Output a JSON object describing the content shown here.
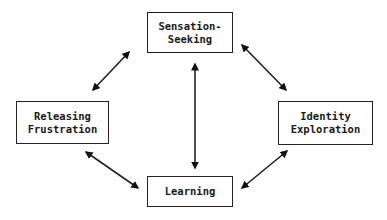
{
  "diagram": {
    "nodes": [
      {
        "id": "sensation",
        "label": "Sensation-\nSeeking"
      },
      {
        "id": "releasing",
        "label": "Releasing\nFrustration"
      },
      {
        "id": "identity",
        "label": "Identity\nExploration"
      },
      {
        "id": "learning",
        "label": "Learning"
      }
    ],
    "edges": [
      {
        "from": "sensation",
        "to": "releasing",
        "type": "bidirectional"
      },
      {
        "from": "sensation",
        "to": "identity",
        "type": "bidirectional"
      },
      {
        "from": "sensation",
        "to": "learning",
        "type": "bidirectional"
      },
      {
        "from": "releasing",
        "to": "learning",
        "type": "bidirectional"
      },
      {
        "from": "identity",
        "to": "learning",
        "type": "bidirectional"
      }
    ],
    "colors": {
      "stroke": "#222222",
      "background": "#ffffff",
      "text": "#1a1a1a"
    }
  }
}
